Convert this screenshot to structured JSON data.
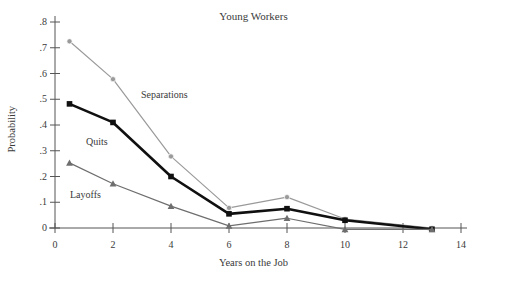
{
  "chart_data": {
    "type": "line",
    "title": "Young Workers",
    "xlabel": "Years on the Job",
    "ylabel": "Probability",
    "xlim": [
      0,
      14
    ],
    "ylim": [
      0,
      0.8
    ],
    "grid": false,
    "legend": "inline-annotations",
    "x_ticks": [
      "0",
      "2",
      "4",
      "6",
      "8",
      "10",
      "12",
      "14"
    ],
    "x_tick_values": [
      0,
      2,
      4,
      6,
      8,
      10,
      12,
      14
    ],
    "y_ticks": [
      "0",
      ".1",
      ".2",
      ".3",
      ".4",
      ".5",
      ".6",
      ".7",
      ".8"
    ],
    "y_tick_values": [
      0,
      0.1,
      0.2,
      0.3,
      0.4,
      0.5,
      0.6,
      0.7,
      0.8
    ],
    "x": [
      0.5,
      2,
      4,
      6,
      8,
      10,
      13
    ],
    "series": [
      {
        "name": "Separations",
        "marker": "circle",
        "color": "#9a9a9a",
        "width": 1.2,
        "values": [
          0.725,
          0.578,
          0.278,
          0.078,
          0.12,
          0.035,
          0.0
        ]
      },
      {
        "name": "Quits",
        "marker": "square",
        "color": "#101010",
        "width": 2.6,
        "values": [
          0.482,
          0.41,
          0.2,
          0.055,
          0.075,
          0.03,
          -0.005
        ]
      },
      {
        "name": "Layoffs",
        "marker": "triangle",
        "color": "#6e6e6e",
        "width": 1.2,
        "values": [
          0.253,
          0.172,
          0.085,
          0.008,
          0.038,
          -0.005,
          -0.005
        ]
      }
    ],
    "annotations": [
      {
        "text": "Separations",
        "x_px": 141,
        "y_px": 90
      },
      {
        "text": "Quits",
        "x_px": 86,
        "y_px": 137
      },
      {
        "text": "Layoffs",
        "x_px": 70,
        "y_px": 190
      }
    ]
  }
}
